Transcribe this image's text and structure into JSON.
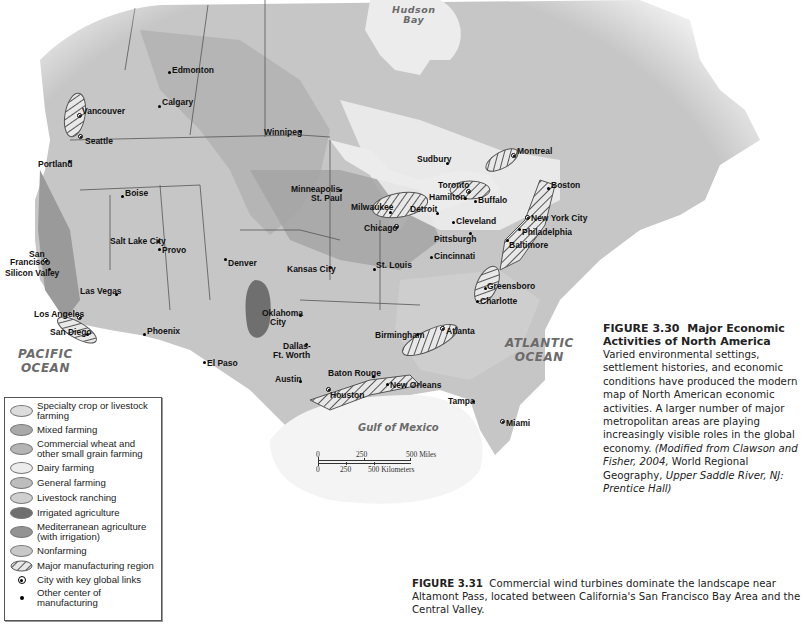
{
  "map": {
    "title": "Major Economic Activities of North America",
    "water_labels": {
      "hudson_bay": "Hudson\nBay",
      "pacific": "PACIFIC\nOCEAN",
      "atlantic": "ATLANTIC\nOCEAN",
      "gulf": "Gulf of Mexico"
    },
    "cities": [
      {
        "name": "Edmonton",
        "type": "manufacturing"
      },
      {
        "name": "Calgary",
        "type": "manufacturing"
      },
      {
        "name": "Vancouver",
        "type": "global"
      },
      {
        "name": "Seattle",
        "type": "global"
      },
      {
        "name": "Portland",
        "type": "manufacturing"
      },
      {
        "name": "Winnipeg",
        "type": "manufacturing"
      },
      {
        "name": "Boise",
        "type": "manufacturing"
      },
      {
        "name": "San Francisco",
        "type": "global"
      },
      {
        "name": "Silicon Valley",
        "type": "manufacturing"
      },
      {
        "name": "Salt Lake City",
        "type": "manufacturing"
      },
      {
        "name": "Provo",
        "type": "manufacturing"
      },
      {
        "name": "Denver",
        "type": "manufacturing"
      },
      {
        "name": "Las Vegas",
        "type": "manufacturing"
      },
      {
        "name": "Los Angeles",
        "type": "global"
      },
      {
        "name": "San Diego",
        "type": "manufacturing"
      },
      {
        "name": "Phoenix",
        "type": "manufacturing"
      },
      {
        "name": "El Paso",
        "type": "manufacturing"
      },
      {
        "name": "Minneapolis-St. Paul",
        "type": "manufacturing"
      },
      {
        "name": "Milwaukee",
        "type": "manufacturing"
      },
      {
        "name": "Chicago",
        "type": "global"
      },
      {
        "name": "Kansas City",
        "type": "manufacturing"
      },
      {
        "name": "St. Louis",
        "type": "manufacturing"
      },
      {
        "name": "Oklahoma City",
        "type": "manufacturing"
      },
      {
        "name": "Dallas-Ft. Worth",
        "type": "manufacturing"
      },
      {
        "name": "Austin",
        "type": "manufacturing"
      },
      {
        "name": "Houston",
        "type": "global"
      },
      {
        "name": "Baton Rouge",
        "type": "manufacturing"
      },
      {
        "name": "New Orleans",
        "type": "manufacturing"
      },
      {
        "name": "Birmingham",
        "type": "manufacturing"
      },
      {
        "name": "Atlanta",
        "type": "global"
      },
      {
        "name": "Charlotte",
        "type": "manufacturing"
      },
      {
        "name": "Greensboro",
        "type": "manufacturing"
      },
      {
        "name": "Tampa",
        "type": "manufacturing"
      },
      {
        "name": "Miami",
        "type": "global"
      },
      {
        "name": "Sudbury",
        "type": "manufacturing"
      },
      {
        "name": "Toronto",
        "type": "global"
      },
      {
        "name": "Hamilton",
        "type": "manufacturing"
      },
      {
        "name": "Buffalo",
        "type": "manufacturing"
      },
      {
        "name": "Detroit",
        "type": "manufacturing"
      },
      {
        "name": "Cleveland",
        "type": "manufacturing"
      },
      {
        "name": "Pittsburgh",
        "type": "manufacturing"
      },
      {
        "name": "Cincinnati",
        "type": "manufacturing"
      },
      {
        "name": "Montreal",
        "type": "global"
      },
      {
        "name": "Boston",
        "type": "manufacturing"
      },
      {
        "name": "New York City",
        "type": "global"
      },
      {
        "name": "Philadelphia",
        "type": "manufacturing"
      },
      {
        "name": "Baltimore",
        "type": "manufacturing"
      }
    ],
    "labels": {
      "edmonton": "Edmonton",
      "calgary": "Calgary",
      "vancouver": "Vancouver",
      "seattle": "Seattle",
      "portland": "Portland",
      "winnipeg": "Winnipeg",
      "boise": "Boise",
      "san_francisco_1": "San",
      "san_francisco_2": "Francisco",
      "silicon_valley": "Silicon Valley",
      "salt_lake_city": "Salt Lake City",
      "provo": "Provo",
      "denver": "Denver",
      "las_vegas": "Las Vegas",
      "los_angeles": "Los Angeles",
      "san_diego": "San Diego",
      "phoenix": "Phoenix",
      "el_paso": "El Paso",
      "minneapolis_1": "Minneapolis-",
      "minneapolis_2": "St. Paul",
      "milwaukee": "Milwaukee",
      "chicago": "Chicago",
      "kansas_city": "Kansas City",
      "st_louis": "St. Louis",
      "oklahoma_1": "Oklahoma",
      "oklahoma_2": "City",
      "dallas_1": "Dallas-",
      "dallas_2": "Ft. Worth",
      "austin": "Austin",
      "houston": "Houston",
      "baton_rouge": "Baton Rouge",
      "new_orleans": "New Orleans",
      "birmingham": "Birmingham",
      "atlanta": "Atlanta",
      "charlotte": "Charlotte",
      "greensboro": "Greensboro",
      "tampa": "Tampa",
      "miami": "Miami",
      "sudbury": "Sudbury",
      "toronto": "Toronto",
      "hamilton": "Hamilton",
      "buffalo": "Buffalo",
      "detroit": "Detroit",
      "cleveland": "Cleveland",
      "pittsburgh": "Pittsburgh",
      "cincinnati": "Cincinnati",
      "montreal": "Montreal",
      "boston": "Boston",
      "new_york": "New York City",
      "philadelphia": "Philadelphia",
      "baltimore": "Baltimore"
    },
    "scale": {
      "miles": {
        "ticks": [
          "0",
          "250",
          "500 Miles"
        ]
      },
      "kilometers": {
        "ticks": [
          "0",
          "250",
          "500 Kilometers"
        ]
      }
    }
  },
  "legend": {
    "items": [
      {
        "label": "Specialty crop or livestock farming",
        "color": "#dcdcdc"
      },
      {
        "label": "Mixed farming",
        "color": "#a9a9a9"
      },
      {
        "label": "Commercial wheat and other small grain farming",
        "color": "#b4b4b4"
      },
      {
        "label": "Dairy farming",
        "color": "#ececec"
      },
      {
        "label": "General farming",
        "color": "#bdbdbd"
      },
      {
        "label": "Livestock ranching",
        "color": "#cfcfcf"
      },
      {
        "label": "Irrigated agriculture",
        "color": "#6f6f6f"
      },
      {
        "label": "Mediterranean agriculture (with irrigation)",
        "color": "#939393"
      },
      {
        "label": "Nonfarming",
        "color": "#c8c8c8"
      },
      {
        "label": "Major manufacturing region",
        "symbol": "hatched-oval"
      },
      {
        "label": "City with key global links",
        "symbol": "circled-dot"
      },
      {
        "label": "Other center of manufacturing",
        "symbol": "dot"
      }
    ]
  },
  "figure_3_30": {
    "number": "FIGURE 3.30",
    "title": "Major Economic Activities of North America",
    "body": "Varied environmental settings, settlement histories, and economic conditions have produced the modern map of North American economic activities. A larger number of major metropolitan areas are playing increasingly visible roles in the global economy.",
    "source_italic_1": "(Modified from Clawson and Fisher, 2004,",
    "source_plain": " World Regional Geography, ",
    "source_italic_2": "Upper Saddle River, NJ: Prentice Hall)"
  },
  "figure_3_31": {
    "number": "FIGURE 3.31",
    "body": "Commercial wind turbines dominate the landscape near Altamont Pass, located between California's San Francisco Bay Area and the Central Valley."
  }
}
